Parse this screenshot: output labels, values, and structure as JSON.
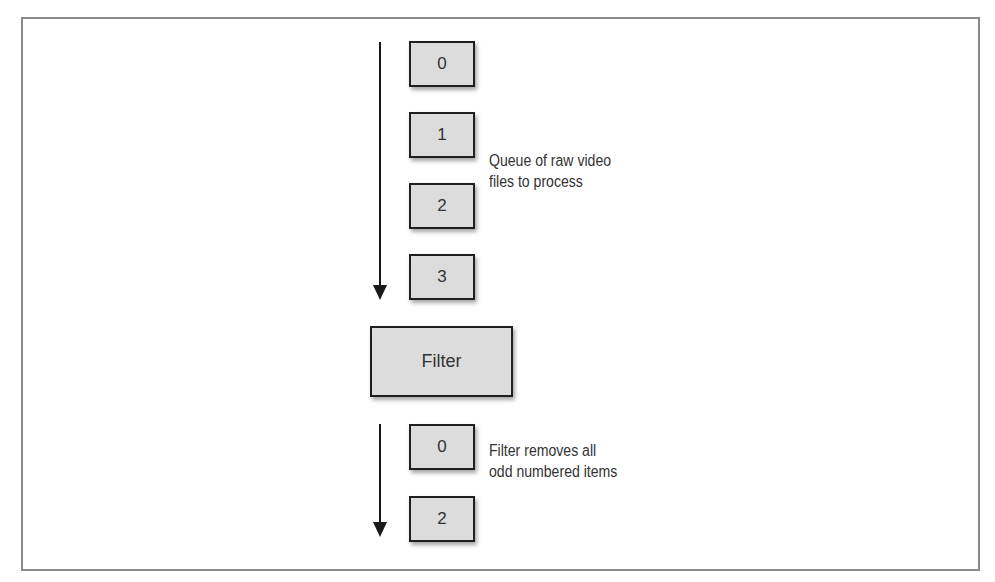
{
  "diagram": {
    "input_queue": {
      "items": [
        "0",
        "1",
        "2",
        "3"
      ],
      "label_line1": "Queue of raw video",
      "label_line2": "files to process"
    },
    "filter": {
      "label": "Filter"
    },
    "output_queue": {
      "items": [
        "0",
        "2"
      ],
      "label_line1": "Filter removes all",
      "label_line2": "odd numbered items"
    },
    "colors": {
      "box_fill": "#dcdcdc",
      "box_border": "#1f1f1f",
      "frame_border": "#8a8a8a",
      "arrow": "#1a1a1a"
    }
  }
}
